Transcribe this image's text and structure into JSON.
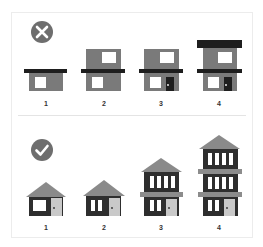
{
  "colors": {
    "body_gray": "#7a7a7a",
    "dark": "#1e1e1e",
    "dark_wall": "#2e2e2e",
    "roof_gray": "#8a8a8a",
    "ledge_gray": "#8c8c8c",
    "door_light": "#c9c9c9",
    "window_white": "#ffffff",
    "icon_gray": "#6e6e6e",
    "border": "#ececec"
  },
  "sections": [
    {
      "name": "wrong",
      "icon": "x-circle-icon",
      "labels": [
        "1",
        "2",
        "3",
        "4"
      ]
    },
    {
      "name": "right",
      "icon": "check-circle-icon",
      "labels": [
        "1",
        "2",
        "3",
        "4"
      ]
    }
  ]
}
